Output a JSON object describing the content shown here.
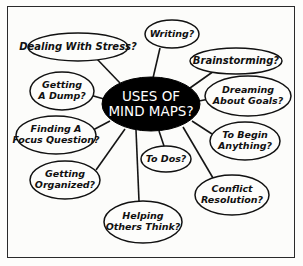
{
  "diagram": {
    "type": "mind-map",
    "background_color": "#fdfdfb",
    "border_color": "#2a2a2a",
    "center": {
      "id": "center-node",
      "lines": [
        "USES OF",
        "MIND MAPS?"
      ],
      "text": "USES OF MIND MAPS?",
      "fill_color": "#000000",
      "text_color": "#ffffff",
      "cx": 151,
      "cy": 104,
      "rx": 49,
      "ry": 27
    },
    "branches": [
      {
        "id": "branch-writing",
        "lines": [
          "Writing?"
        ],
        "text": "Writing?",
        "cx": 172,
        "cy": 34,
        "rx": 27,
        "ry": 14,
        "anchor_x": 160,
        "anchor_y": 48,
        "link_x": 153,
        "link_y": 78
      },
      {
        "id": "branch-dealing-with-stress",
        "lines": [
          "Dealing With Stress?"
        ],
        "text": "Dealing With Stress?",
        "cx": 78,
        "cy": 47,
        "rx": 50,
        "ry": 14,
        "anchor_x": 96,
        "anchor_y": 58,
        "link_x": 120,
        "link_y": 83
      },
      {
        "id": "branch-brainstorming",
        "lines": [
          "Brainstorming?"
        ],
        "text": "Brainstorming?",
        "cx": 236,
        "cy": 61,
        "rx": 46,
        "ry": 13,
        "anchor_x": 214,
        "anchor_y": 71,
        "link_x": 190,
        "link_y": 88
      },
      {
        "id": "branch-getting-a-dump",
        "lines": [
          "Getting",
          "A Dump?"
        ],
        "text": "Getting A Dump?",
        "cx": 62,
        "cy": 91,
        "rx": 32,
        "ry": 19,
        "anchor_x": 90,
        "anchor_y": 95,
        "link_x": 104,
        "link_y": 99
      },
      {
        "id": "branch-dreaming-about-goals",
        "lines": [
          "Dreaming",
          "About Goals?"
        ],
        "text": "Dreaming About Goals?",
        "cx": 248,
        "cy": 96,
        "rx": 43,
        "ry": 20,
        "anchor_x": 209,
        "anchor_y": 99,
        "link_x": 199,
        "link_y": 101
      },
      {
        "id": "branch-finding-a-focus-question",
        "lines": [
          "Finding A",
          "Focus Question?"
        ],
        "text": "Finding A Focus Question?",
        "cx": 56,
        "cy": 135,
        "rx": 40,
        "ry": 19,
        "anchor_x": 93,
        "anchor_y": 130,
        "link_x": 110,
        "link_y": 121
      },
      {
        "id": "branch-to-begin-anything",
        "lines": [
          "To Begin",
          "Anything?"
        ],
        "text": "To Begin Anything?",
        "cx": 245,
        "cy": 141,
        "rx": 35,
        "ry": 19,
        "anchor_x": 212,
        "anchor_y": 134,
        "link_x": 192,
        "link_y": 121
      },
      {
        "id": "branch-getting-organized",
        "lines": [
          "Getting",
          "Organized?"
        ],
        "text": "Getting Organized?",
        "cx": 65,
        "cy": 180,
        "rx": 35,
        "ry": 19,
        "anchor_x": 96,
        "anchor_y": 170,
        "link_x": 125,
        "link_y": 129
      },
      {
        "id": "branch-to-dos",
        "lines": [
          "To Dos?"
        ],
        "text": "To Dos?",
        "cx": 166,
        "cy": 159,
        "rx": 25,
        "ry": 13,
        "anchor_x": 164,
        "anchor_y": 146,
        "link_x": 159,
        "link_y": 131
      },
      {
        "id": "branch-conflict-resolution",
        "lines": [
          "Conflict",
          "Resolution?"
        ],
        "text": "Conflict Resolution?",
        "cx": 232,
        "cy": 195,
        "rx": 37,
        "ry": 20,
        "anchor_x": 213,
        "anchor_y": 178,
        "link_x": 183,
        "link_y": 127
      },
      {
        "id": "branch-helping-others-think",
        "lines": [
          "Helping",
          "Others Think?"
        ],
        "text": "Helping Others Think?",
        "cx": 143,
        "cy": 222,
        "rx": 39,
        "ry": 21,
        "anchor_x": 139,
        "anchor_y": 201,
        "link_x": 136,
        "link_y": 130
      }
    ]
  }
}
